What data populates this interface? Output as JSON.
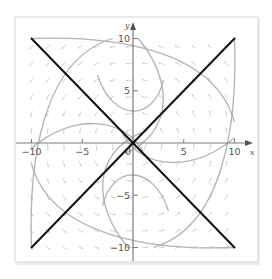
{
  "figure": {
    "type": "phase-portrait",
    "axes": {
      "x_label": "x",
      "y_label": "y",
      "x_range": [
        -10.5,
        11
      ],
      "y_range": [
        -11,
        11
      ],
      "x_ticks": [
        {
          "value": -10,
          "label": "−10"
        },
        {
          "value": -5,
          "label": "−5"
        },
        {
          "value": 0,
          "label": "0"
        },
        {
          "value": 5,
          "label": "5"
        },
        {
          "value": 10,
          "label": "10"
        }
      ],
      "y_ticks": [
        {
          "value": 10,
          "label": "10"
        },
        {
          "value": 5,
          "label": "5"
        },
        {
          "value": -5,
          "label": "−5"
        },
        {
          "value": -10,
          "label": "−10"
        }
      ]
    },
    "straight_line_solutions": [
      {
        "name": "y = x",
        "from": [
          -10,
          -10
        ],
        "to": [
          10,
          10
        ],
        "color": "#111111"
      },
      {
        "name": "y = -x",
        "from": [
          -10,
          10
        ],
        "to": [
          10,
          -10
        ],
        "color": "#111111"
      }
    ],
    "trajectory_color": "#b3b3b3",
    "vector_field_color": "#c4c4c4",
    "equilibrium": {
      "x": 0,
      "y": 0
    }
  }
}
